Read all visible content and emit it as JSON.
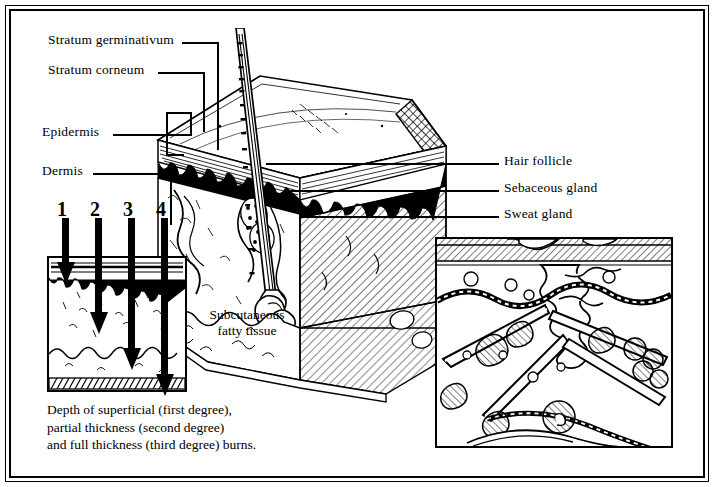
{
  "figure": {
    "type": "anatomical-illustration",
    "style": "black-and-white line engraving"
  },
  "labels_left": [
    {
      "id": "stratum-germinativum",
      "text": "Stratum germinativum"
    },
    {
      "id": "stratum-corneum",
      "text": "Stratum corneum"
    },
    {
      "id": "epidermis",
      "text": "Epidermis"
    },
    {
      "id": "dermis",
      "text": "Dermis"
    }
  ],
  "labels_right": [
    {
      "id": "hair-follicle",
      "text": "Hair follicle"
    },
    {
      "id": "sebaceous-gland",
      "text": "Sebaceous gland"
    },
    {
      "id": "sweat-gland",
      "text": "Sweat gland"
    }
  ],
  "labels_inline": [
    {
      "id": "subcutaneous-fatty-tissue",
      "line1": "Subcutaneous",
      "line2": "fatty tissue"
    }
  ],
  "burn_diagram": {
    "numbers": [
      "1",
      "2",
      "3",
      "4"
    ],
    "caption_line1": "Depth of superficial (first degree),",
    "caption_line2": "partial thickness (second degree)",
    "caption_line3": "and full thickness (third degree) burns."
  },
  "colors": {
    "ink": "#000000",
    "paper": "#ffffff",
    "hatch": "#2b2b2b"
  }
}
